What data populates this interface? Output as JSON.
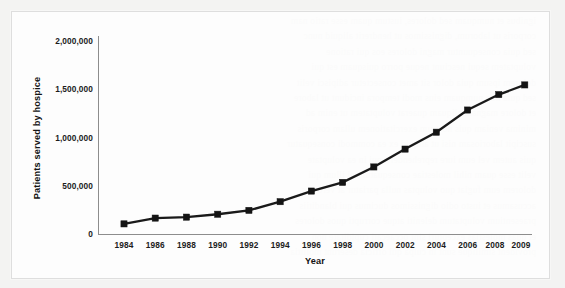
{
  "figure": {
    "card_label": "hospice-patients-line-chart"
  },
  "chart_data": {
    "type": "line",
    "title": "",
    "xlabel": "Year",
    "ylabel": "Patients served by hospice",
    "x": [
      1984,
      1986,
      1988,
      1990,
      1992,
      1994,
      1996,
      1998,
      2000,
      2002,
      2004,
      2006,
      2008,
      2009
    ],
    "categories": [
      "1984",
      "1986",
      "1988",
      "1990",
      "1992",
      "1994",
      "1996",
      "1998",
      "2000",
      "2002",
      "2004",
      "2006",
      "2008",
      "2009"
    ],
    "values": [
      110000,
      170000,
      180000,
      210000,
      250000,
      340000,
      450000,
      540000,
      700000,
      885000,
      1060000,
      1290000,
      1450000,
      1550000
    ],
    "series": [
      {
        "name": "Patients served by hospice",
        "values": [
          110000,
          170000,
          180000,
          210000,
          250000,
          340000,
          450000,
          540000,
          700000,
          885000,
          1060000,
          1290000,
          1450000,
          1550000
        ]
      }
    ],
    "ylim": [
      0,
      2000000
    ],
    "ytick_values": [
      0,
      500000,
      1000000,
      1500000,
      2000000
    ],
    "ytick_labels": [
      "0",
      "500,000",
      "1,000,000",
      "1,500,000",
      "2,000,000"
    ],
    "xtick_labels": [
      "1984",
      "1986",
      "1988",
      "1990",
      "1992",
      "1994",
      "1996",
      "1998",
      "2000",
      "2002",
      "2004",
      "2006",
      "2008",
      "2009"
    ],
    "grid": false,
    "legend": false,
    "legend_position": "none",
    "marker": "square",
    "line_color": "#1a1a1a",
    "marker_color": "#141414",
    "axis_color": "#8d8d8d",
    "background_color": "#ffffff"
  },
  "axes": {
    "y_title": "Patients served by hospice",
    "x_title": "Year",
    "y_ticks": [
      {
        "label": "2,000,000"
      },
      {
        "label": "1,500,000"
      },
      {
        "label": "1,000,000"
      },
      {
        "label": "500,000"
      },
      {
        "label": "0"
      }
    ],
    "x_ticks": [
      {
        "label": "1984"
      },
      {
        "label": "1986"
      },
      {
        "label": "1988"
      },
      {
        "label": "1990"
      },
      {
        "label": "1992"
      },
      {
        "label": "1994"
      },
      {
        "label": "1996"
      },
      {
        "label": "1998"
      },
      {
        "label": "2000"
      },
      {
        "label": "2002"
      },
      {
        "label": "2004"
      },
      {
        "label": "2006"
      },
      {
        "label": "2008"
      },
      {
        "label": "2009"
      }
    ]
  },
  "bleed": {
    "lines": [
      "ignibus et numquam sed dolores, iustum quam esse ratio nam",
      "corporis ut laborum, dignissimos ut hendrerit aliquid nunc",
      "sed quia consequuntur magni dolores eos qui ratione",
      "voluptatem sequi nesciunt neque porro quisquam est qui",
      "dolorem ipsum quia dolor sit amet consectetur adipisci velit",
      "sed quia non numquam eius modi tempora incidunt ut labore",
      "et dolore magnam aliquam quaerat voluptatem ut enim ad",
      "minima veniam quis nostrum exercitationem ullam corporis",
      "suscipit laboriosam nisi ut aliquid ex ea commodi consequatur",
      "quis autem vel eum iure reprehenderit qui in ea voluptate",
      "velit esse quam nihil molestiae consequatur vel illum qui",
      "dolorem eum fugiat quo voluptas nulla pariatur at vero eos",
      "accusamus et iusto odio dignissimos ducimus qui blanditiis",
      "praesentium voluptatum deleniti atque corrupti quos dolores",
      "et quas molestias excepturi sint occaecati cupiditate non",
      "provident similique sunt in culpa qui officia deserunt mollitia"
    ]
  }
}
